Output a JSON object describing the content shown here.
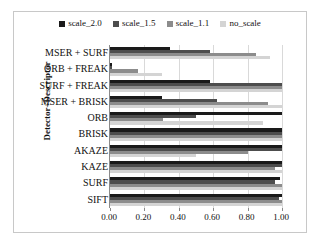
{
  "chart_data": {
    "type": "bar",
    "orientation": "horizontal",
    "title": "",
    "xlabel": "",
    "ylabel": "Detector+Descriptor",
    "xlim": [
      0.0,
      1.0
    ],
    "grid": true,
    "legend_position": "top",
    "xticks": [
      "0.00",
      "0.20",
      "0.40",
      "0.60",
      "0.80",
      "1.00"
    ],
    "xtick_values": [
      0.0,
      0.2,
      0.4,
      0.6,
      0.8,
      1.0
    ],
    "categories": [
      "MSER + SURF",
      "ORB + FREAK",
      "SURF + FREAK",
      "MSER + BRISK",
      "ORB",
      "BRISK",
      "AKAZE",
      "KAZE",
      "SURF",
      "SIFT"
    ],
    "series": [
      {
        "name": "scale_2.0",
        "color": "#1a1a1a",
        "values": [
          0.35,
          0.01,
          0.58,
          0.3,
          1.0,
          1.0,
          1.0,
          1.0,
          0.99,
          1.0
        ]
      },
      {
        "name": "scale_1.5",
        "color": "#4d4d4d",
        "values": [
          0.58,
          0.01,
          1.0,
          0.62,
          0.5,
          1.0,
          1.0,
          1.0,
          0.96,
          0.98
        ]
      },
      {
        "name": "scale_1.1",
        "color": "#8c8c8c",
        "values": [
          0.85,
          0.16,
          1.0,
          0.92,
          0.31,
          1.0,
          0.8,
          0.96,
          1.0,
          1.0
        ]
      },
      {
        "name": "no_scale",
        "color": "#d4d4d4",
        "values": [
          0.93,
          0.3,
          1.0,
          1.0,
          0.89,
          1.0,
          0.5,
          1.0,
          1.0,
          1.0
        ]
      }
    ]
  },
  "legend": {
    "items": [
      {
        "label": "scale_2.0",
        "color": "#1a1a1a"
      },
      {
        "label": "scale_1.5",
        "color": "#4d4d4d"
      },
      {
        "label": "scale_1.1",
        "color": "#8c8c8c"
      },
      {
        "label": "no_scale",
        "color": "#d4d4d4"
      }
    ]
  },
  "axis": {
    "y_title": "Detector+Descriptor"
  },
  "colors": {
    "frame_border": "#c8c8c8",
    "gridline": "#d9d9d9",
    "axis_line": "#8a8a8a",
    "text": "#111111",
    "background": "#ffffff"
  }
}
